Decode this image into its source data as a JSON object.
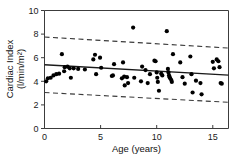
{
  "chart_data": {
    "type": "scatter",
    "title": "",
    "subtitle": "",
    "xlabel": "Age (years)",
    "ylabel": "Cardiac Index",
    "ylabel_units": "(l/min/m2)",
    "ylabel_units_display": "(l/min/m²)",
    "xlim": [
      0,
      16.4
    ],
    "ylim": [
      0,
      10
    ],
    "xticks": [
      0,
      5,
      10,
      15
    ],
    "xticklabels": [
      "0",
      "5",
      "10",
      "15"
    ],
    "yticks": [
      0,
      2,
      4,
      6,
      8,
      10
    ],
    "yticklabels": [
      "0",
      "2",
      "4",
      "6",
      "8",
      "10"
    ],
    "grid": false,
    "legend": false,
    "legend_position": "none",
    "point_color": "#000000",
    "line_color": "#1a1a1a",
    "frame_color": "#3c3c3c",
    "series": [
      {
        "name": "Cardiac index observations",
        "type": "scatter",
        "marker": "filled-circle",
        "x": [
          0.15,
          0.3,
          0.55,
          0.8,
          1.05,
          1.3,
          1.55,
          1.75,
          1.8,
          2.05,
          2.25,
          2.35,
          2.6,
          3.0,
          3.6,
          4.35,
          4.5,
          4.6,
          4.95,
          5.05,
          6.0,
          6.1,
          6.2,
          6.9,
          7.0,
          7.1,
          7.15,
          7.35,
          7.45,
          7.9,
          8.0,
          8.6,
          8.7,
          9.0,
          9.2,
          9.4,
          9.8,
          9.9,
          10.0,
          10.05,
          10.1,
          10.2,
          10.4,
          10.5,
          10.9,
          11.0,
          11.05,
          11.1,
          11.15,
          11.2,
          11.3,
          11.35,
          11.45,
          12.1,
          12.3,
          12.5,
          13.0,
          13.1,
          13.2,
          13.5,
          13.9,
          14.0,
          15.0,
          15.1,
          15.35,
          15.5,
          15.6,
          15.7,
          15.8
        ],
        "y": [
          4.0,
          4.25,
          4.3,
          4.5,
          4.6,
          4.65,
          6.3,
          4.85,
          5.2,
          5.25,
          5.1,
          4.3,
          5.1,
          5.05,
          5.0,
          5.85,
          6.25,
          4.6,
          6.0,
          5.15,
          4.45,
          4.5,
          5.45,
          4.25,
          5.6,
          4.4,
          3.65,
          4.35,
          3.85,
          8.55,
          4.3,
          4.0,
          5.25,
          4.95,
          3.85,
          4.6,
          5.75,
          5.7,
          4.75,
          4.3,
          3.95,
          3.2,
          4.65,
          4.5,
          8.25,
          5.05,
          4.75,
          4.5,
          4.35,
          4.25,
          4.1,
          3.95,
          6.3,
          5.6,
          4.35,
          3.8,
          6.1,
          4.6,
          3.05,
          4.05,
          3.85,
          2.9,
          5.65,
          5.1,
          5.85,
          5.7,
          5.2,
          3.85,
          3.8
        ]
      }
    ],
    "regression_line": {
      "name": "Regression line",
      "x": [
        0,
        16.4
      ],
      "y": [
        5.4,
        4.52
      ],
      "style": "solid"
    },
    "confidence_bands": [
      {
        "name": "Upper 95% limit",
        "x": [
          0,
          16.4
        ],
        "y": [
          7.75,
          6.82
        ],
        "style": "dashed"
      },
      {
        "name": "Lower 95% limit",
        "x": [
          0,
          16.4
        ],
        "y": [
          3.05,
          2.22
        ],
        "style": "dashed"
      }
    ]
  },
  "figure": {
    "background": "#ffffff",
    "caption": ""
  }
}
